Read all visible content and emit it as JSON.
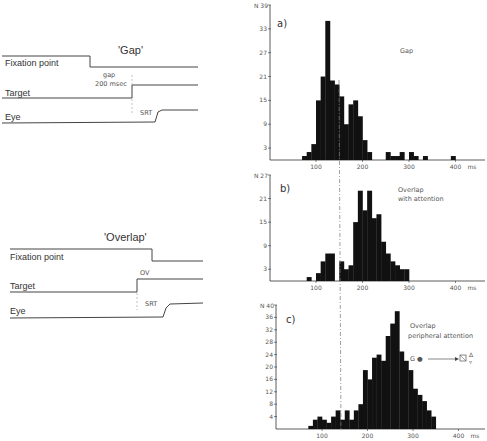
{
  "timing_diagrams": [
    {
      "title": "'Gap'",
      "rows": [
        "Fixation point",
        "Target",
        "Eye"
      ],
      "annotations": [
        "gap",
        "200 msec",
        "SRT"
      ]
    },
    {
      "title": "'Overlap'",
      "rows": [
        "Fixation point",
        "Target",
        "Eye"
      ],
      "annotations": [
        "OV",
        "SRT"
      ]
    }
  ],
  "chart_data": [
    {
      "type": "bar",
      "panel": "a)",
      "title": "Gap",
      "xlabel": "ms",
      "ylabel": "N",
      "ylim": [
        0,
        39
      ],
      "xlim": [
        0,
        420
      ],
      "yticks": [
        3,
        9,
        15,
        21,
        27,
        33,
        39
      ],
      "xticks": [
        100,
        200,
        300,
        400
      ],
      "bin_width": 10,
      "bins": [
        70,
        80,
        90,
        100,
        110,
        120,
        130,
        140,
        150,
        160,
        170,
        180,
        190,
        200,
        210,
        250,
        260,
        270,
        280,
        290,
        300,
        310,
        320,
        330,
        390
      ],
      "values": [
        1,
        2,
        4,
        15,
        21,
        35,
        20,
        19,
        16,
        9,
        14,
        15,
        11,
        5,
        2,
        2,
        1,
        1,
        2,
        0,
        2,
        1,
        0,
        1,
        1
      ]
    },
    {
      "type": "bar",
      "panel": "b)",
      "title": "Overlap with attention",
      "xlabel": "ms",
      "ylabel": "N",
      "ylim": [
        0,
        27
      ],
      "yticks": [
        3,
        9,
        15,
        21,
        27
      ],
      "xticks": [
        100,
        200,
        300,
        400
      ],
      "bin_width": 10,
      "bins": [
        80,
        90,
        100,
        110,
        120,
        130,
        140,
        150,
        160,
        170,
        180,
        190,
        200,
        210,
        220,
        230,
        240,
        250,
        260,
        270,
        280,
        290
      ],
      "values": [
        1,
        0,
        2,
        5,
        7,
        7,
        0,
        5,
        3,
        4,
        15,
        23,
        18,
        23,
        16,
        17,
        10,
        7,
        5,
        4,
        3,
        3
      ]
    },
    {
      "type": "bar",
      "panel": "c)",
      "title": "Overlap peripheral attention",
      "xlabel": "ms",
      "ylabel": "N",
      "ylim": [
        0,
        40
      ],
      "yticks": [
        4,
        8,
        12,
        16,
        20,
        24,
        28,
        32,
        36,
        40
      ],
      "xticks": [
        100,
        200,
        300,
        400
      ],
      "bin_width": 10,
      "bins": [
        70,
        80,
        90,
        100,
        110,
        120,
        130,
        140,
        150,
        160,
        170,
        180,
        190,
        200,
        210,
        220,
        230,
        240,
        250,
        260,
        270,
        280,
        290,
        300,
        310,
        320,
        330,
        340
      ],
      "values": [
        1,
        3,
        4,
        3,
        2,
        4,
        6,
        3,
        6,
        3,
        6,
        8,
        19,
        16,
        23,
        24,
        22,
        30,
        34,
        38,
        25,
        22,
        19,
        13,
        11,
        9,
        6,
        4
      ]
    }
  ],
  "shared_marker_ms": 150,
  "legend_c": {
    "text": "G ● ———▶ ⊠",
    "arrows": "Δ ▼"
  }
}
